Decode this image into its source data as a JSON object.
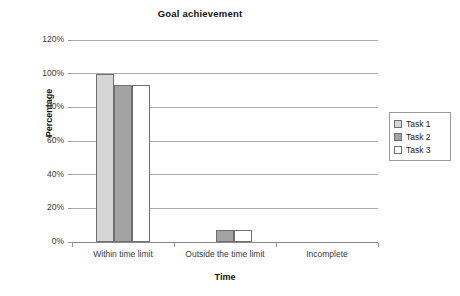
{
  "chart_data": {
    "type": "bar",
    "title": "Goal achievement",
    "xlabel": "Time",
    "ylabel": "Percentage",
    "categories": [
      "Within time limit",
      "Outside the time limit",
      "Incomplete"
    ],
    "series": [
      {
        "name": "Task 1",
        "values": [
          100,
          0,
          0
        ],
        "color": "#d6d6d6"
      },
      {
        "name": "Task 2",
        "values": [
          93,
          7,
          0
        ],
        "color": "#a3a3a3"
      },
      {
        "name": "Task 3",
        "values": [
          93,
          7,
          0
        ],
        "color": "#ffffff"
      }
    ],
    "ylim": [
      0,
      120
    ],
    "yticks": [
      0,
      20,
      40,
      60,
      80,
      100,
      120
    ],
    "ytick_labels": [
      "0%",
      "20%",
      "40%",
      "60%",
      "80%",
      "100%",
      "120%"
    ],
    "grid": true,
    "legend_position": "right",
    "value_suffix": "%"
  },
  "legend": {
    "entries": [
      "Task 1",
      "Task 2",
      "Task 3"
    ]
  },
  "colors": {
    "task1": "#d6d6d6",
    "task2": "#a3a3a3",
    "task3": "#ffffff",
    "bar_border": "#6f6f6f",
    "gridline": "#adadad",
    "axis": "#9a9a9a",
    "text": "#222222",
    "background": "#ffffff"
  }
}
